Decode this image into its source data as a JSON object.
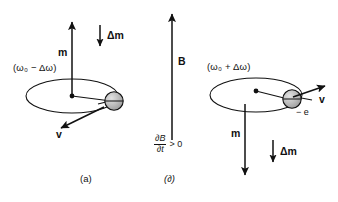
{
  "figure": {
    "type": "physics-diagram",
    "background_color": "#ffffff",
    "stroke_color": "#111111",
    "sphere_fill": "#b9b9b9"
  },
  "panel_a": {
    "caption": "(a)",
    "omega_label": "(ω₀ − Δω)",
    "moment_label": "m",
    "delta_moment_label": "Δm",
    "velocity_label": "v",
    "moment_direction": "up",
    "delta_moment_direction": "down",
    "velocity_direction": "down-left"
  },
  "panel_b": {
    "caption": "(∂)",
    "omega_label": "(ω₀ + Δω)",
    "moment_label": "m",
    "delta_moment_label": "Δm",
    "velocity_label": "v",
    "charge_label": "− e",
    "moment_direction": "down",
    "delta_moment_direction": "down",
    "velocity_direction": "up-right"
  },
  "field": {
    "field_label": "B",
    "field_direction": "up",
    "rate_numerator": "∂B",
    "rate_denominator": "∂t",
    "rate_comparison": "> 0"
  }
}
